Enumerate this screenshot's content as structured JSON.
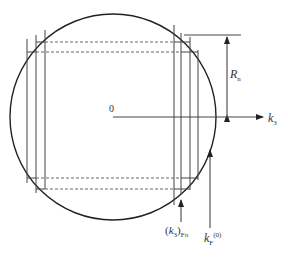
{
  "diagram": {
    "type": "fermi-sphere-landau-levels",
    "colors": {
      "stroke": "#222222",
      "line": "#444444",
      "dashed": "#555555",
      "background": "#ffffff"
    },
    "circle": {
      "cx": 113,
      "cy": 117,
      "r": 103
    },
    "labels": {
      "origin": "0",
      "radius": {
        "main": "R",
        "sub": "n"
      },
      "axis": {
        "main": "k",
        "sub": "3"
      },
      "k3_fermi_n": {
        "open": "(",
        "main": "k",
        "sub_inner": "3",
        "close": ")",
        "sub": "F",
        "sub_n": "n"
      },
      "kf_zero": {
        "main": "k",
        "sub": "F",
        "sup": "(0)"
      }
    }
  }
}
